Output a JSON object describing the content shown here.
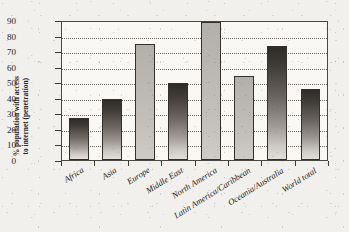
{
  "chart_data": {
    "type": "bar",
    "title": "",
    "subtitle": "",
    "xlabel": "",
    "ylabel": "% population with access to internet (penetration)",
    "ylabel_line1": "% population with access",
    "ylabel_line2": "to internet (penetration)",
    "ylim": [
      0,
      90
    ],
    "ytick_step": 10,
    "yticks": [
      "90",
      "80",
      "70",
      "60",
      "50",
      "40",
      "30",
      "20",
      "10",
      "0"
    ],
    "ytick_values": [
      90,
      80,
      70,
      60,
      50,
      40,
      30,
      20,
      10,
      0
    ],
    "grid": true,
    "grid_style": "dotted-horizontal",
    "legend": "none",
    "categories": [
      "Africa",
      "Asia",
      "Europe",
      "Middle East",
      "North America",
      "Latin America/Caribbean",
      "Oceania/Australia",
      "World total"
    ],
    "values": [
      27,
      39.5,
      74.5,
      49.5,
      89,
      54,
      73.5,
      45.5
    ],
    "bar_shades": [
      "dark",
      "dark",
      "light",
      "dark",
      "light",
      "light",
      "dark",
      "dark"
    ],
    "axis_label_rotation_deg": -32
  },
  "colors": {
    "page_background": "#f2f0ec",
    "plot_background": "#faf8f5",
    "axis": "#4a4642",
    "gridline": "#6d6863",
    "text": "#26231f",
    "bar_dark_top": "#2e2b28",
    "bar_dark_bottom": "#e2dfda",
    "bar_light": "#c4c0bb"
  }
}
